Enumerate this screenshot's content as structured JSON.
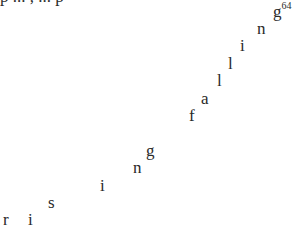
{
  "clipped_line": "p   ...   ,  ...  p",
  "falling": {
    "word": "falling",
    "footnote": "64",
    "letters": [
      {
        "ch": "f",
        "x": 189,
        "y": 107
      },
      {
        "ch": "a",
        "x": 201,
        "y": 90
      },
      {
        "ch": "l",
        "x": 217,
        "y": 72
      },
      {
        "ch": "l",
        "x": 228,
        "y": 55
      },
      {
        "ch": "i",
        "x": 240,
        "y": 37
      },
      {
        "ch": "n",
        "x": 257,
        "y": 20
      },
      {
        "ch": "g",
        "x": 273,
        "y": 3
      }
    ]
  },
  "rising": {
    "word": "rising",
    "letters": [
      {
        "ch": "r",
        "x": 3,
        "y": 211
      },
      {
        "ch": "i",
        "x": 28,
        "y": 211
      },
      {
        "ch": "s",
        "x": 48,
        "y": 194
      },
      {
        "ch": "i",
        "x": 100,
        "y": 177
      },
      {
        "ch": "n",
        "x": 133,
        "y": 159
      },
      {
        "ch": "g",
        "x": 146,
        "y": 142
      }
    ]
  }
}
